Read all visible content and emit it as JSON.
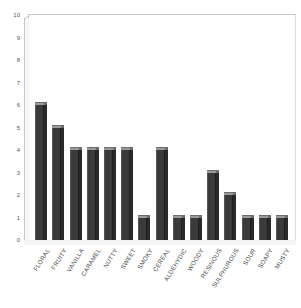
{
  "chart_data": {
    "type": "bar",
    "title": "",
    "xlabel": "",
    "ylabel": "",
    "ylim": [
      0,
      10
    ],
    "ytick_labels": [
      "10",
      "9",
      "8",
      "7",
      "6",
      "5",
      "4",
      "3",
      "2",
      "1",
      "0"
    ],
    "ytick_values": [
      10,
      9,
      8,
      7,
      6,
      5,
      4,
      3,
      2,
      1,
      0
    ],
    "grid": false,
    "legend": "none",
    "categories": [
      "FLORAL",
      "FRUITY",
      "VANILLA",
      "CARAMEL",
      "NUTTY",
      "SWEET",
      "SMOKY",
      "CEREAL",
      "ALDEHYDIC",
      "WOODY",
      "RESINOUS",
      "SULPHUROUS",
      "SOUR",
      "SOAPY",
      "MUSTY"
    ],
    "values": [
      6,
      5,
      4,
      4,
      4,
      4,
      1,
      4,
      1,
      1,
      3,
      2,
      1,
      1,
      1
    ],
    "bar_color": "#3a3a3a",
    "plot_background": "#ffffff",
    "axis_color": "#c8c8c8",
    "tick_label_color": "#555555"
  }
}
